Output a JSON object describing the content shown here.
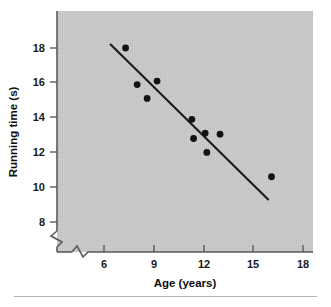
{
  "chart_data": {
    "type": "scatter",
    "title": "",
    "xlabel": "Age (years)",
    "ylabel": "Running time (s)",
    "xlim": [
      5.2,
      18.6
    ],
    "ylim": [
      7.0,
      19.0
    ],
    "xticks": [
      6,
      9,
      12,
      15,
      18
    ],
    "xtick_labels": [
      "6",
      "9",
      "12",
      "15",
      "18"
    ],
    "yticks": [
      8,
      10,
      12,
      14,
      16,
      18
    ],
    "ytick_labels": [
      "8",
      "10",
      "12",
      "14",
      "16",
      "18"
    ],
    "grid": false,
    "legend": "none",
    "axis_break_x": true,
    "axis_break_y": true,
    "background_color": "#c9c9c9",
    "point_color": "#131313",
    "line_color": "#1b1b1b",
    "series": [
      {
        "name": "Runners",
        "marker": "filled-circle",
        "points": [
          {
            "x": 7.3,
            "y": 18.0
          },
          {
            "x": 8.0,
            "y": 15.9
          },
          {
            "x": 8.6,
            "y": 15.1
          },
          {
            "x": 9.2,
            "y": 16.1
          },
          {
            "x": 11.3,
            "y": 13.9
          },
          {
            "x": 11.4,
            "y": 12.8
          },
          {
            "x": 12.1,
            "y": 13.1
          },
          {
            "x": 12.2,
            "y": 12.0
          },
          {
            "x": 13.0,
            "y": 13.05
          },
          {
            "x": 16.1,
            "y": 10.6
          }
        ]
      }
    ],
    "fit_line": {
      "type": "linear-regression",
      "x_start": 6.4,
      "y_start": 18.2,
      "x_end": 15.9,
      "y_end": 9.3
    }
  }
}
